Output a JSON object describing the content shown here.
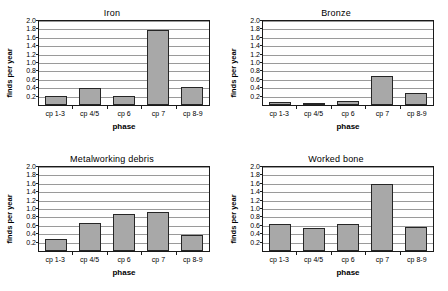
{
  "figure": {
    "axis": {
      "xlabel": "phase",
      "ylabel": "finds per year",
      "yticks": [
        "0.2",
        "0.4",
        "0.6",
        "0.8",
        "1.0",
        "1.2",
        "1.4",
        "1.6",
        "1.8",
        "2.0"
      ],
      "ymin": 0,
      "ymax": 2.0,
      "categories": [
        "cp 1-3",
        "cp 4/5",
        "cp 6",
        "cp 7",
        "cp 8-9"
      ]
    },
    "colors": {
      "bar_fill": "#a8a8a8",
      "bar_border": "#262626",
      "gridline": "#9a9a9a",
      "axis": "#1a1a1a",
      "background": "#ffffff"
    },
    "panels": [
      {
        "title": "Iron"
      },
      {
        "title": "Bronze"
      },
      {
        "title": "Metalworking debris"
      },
      {
        "title": "Worked bone"
      }
    ]
  },
  "chart_data": [
    {
      "type": "bar",
      "title": "Iron",
      "xlabel": "phase",
      "ylabel": "finds per year",
      "categories": [
        "cp 1-3",
        "cp 4/5",
        "cp 6",
        "cp 7",
        "cp 8-9"
      ],
      "values": [
        0.21,
        0.4,
        0.22,
        1.79,
        0.43
      ],
      "ylim": [
        0,
        2.0
      ],
      "ytick_step": 0.2,
      "grid": true,
      "legend": "none"
    },
    {
      "type": "bar",
      "title": "Bronze",
      "xlabel": "phase",
      "ylabel": "finds per year",
      "categories": [
        "cp 1-3",
        "cp 4/5",
        "cp 6",
        "cp 7",
        "cp 8-9"
      ],
      "values": [
        0.08,
        0.05,
        0.09,
        0.7,
        0.29
      ],
      "ylim": [
        0,
        2.0
      ],
      "ytick_step": 0.2,
      "grid": true,
      "legend": "none"
    },
    {
      "type": "bar",
      "title": "Metalworking debris",
      "xlabel": "phase",
      "ylabel": "finds per year",
      "categories": [
        "cp 1-3",
        "cp 4/5",
        "cp 6",
        "cp 7",
        "cp 8-9"
      ],
      "values": [
        0.28,
        0.67,
        0.89,
        0.93,
        0.37
      ],
      "ylim": [
        0,
        2.0
      ],
      "ytick_step": 0.2,
      "grid": true,
      "legend": "none"
    },
    {
      "type": "bar",
      "title": "Worked bone",
      "xlabel": "phase",
      "ylabel": "finds per year",
      "categories": [
        "cp 1-3",
        "cp 4/5",
        "cp 6",
        "cp 7",
        "cp 8-9"
      ],
      "values": [
        0.64,
        0.55,
        0.65,
        1.6,
        0.58
      ],
      "ylim": [
        0,
        2.0
      ],
      "ytick_step": 0.2,
      "grid": true,
      "legend": "none"
    }
  ]
}
